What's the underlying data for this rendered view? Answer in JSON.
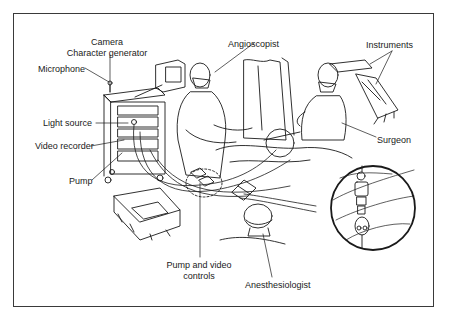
{
  "figure": {
    "type": "line-art illustration",
    "labels": [
      {
        "id": "camera",
        "text": "Camera",
        "x": 107,
        "y": 37,
        "align": "center"
      },
      {
        "id": "character-generator",
        "text": "Character generator",
        "x": 107,
        "y": 48,
        "align": "center"
      },
      {
        "id": "microphone",
        "text": "Microphone",
        "x": 38,
        "y": 64,
        "align": "left"
      },
      {
        "id": "angioscopist",
        "text": "Angioscopist",
        "x": 228,
        "y": 39,
        "align": "left"
      },
      {
        "id": "instruments",
        "text": "Instruments",
        "x": 366,
        "y": 40,
        "align": "left"
      },
      {
        "id": "light-source",
        "text": "Light source",
        "x": 43,
        "y": 118,
        "align": "left"
      },
      {
        "id": "video-recorder",
        "text": "Video recorder",
        "x": 35,
        "y": 141,
        "align": "left"
      },
      {
        "id": "surgeon",
        "text": "Surgeon",
        "x": 377,
        "y": 135,
        "align": "left"
      },
      {
        "id": "pump",
        "text": "Pump",
        "x": 69,
        "y": 176,
        "align": "left"
      },
      {
        "id": "pump-and-video-controls-1",
        "text": "Pump and video",
        "x": 199,
        "y": 260,
        "align": "center"
      },
      {
        "id": "pump-and-video-controls-2",
        "text": "controls",
        "x": 199,
        "y": 271,
        "align": "center"
      },
      {
        "id": "anesthesiologist",
        "text": "Anesthesiologist",
        "x": 245,
        "y": 280,
        "align": "left"
      }
    ]
  },
  "colors": {
    "ink": "#1a1a1a",
    "frame": "#3a3a3a",
    "background": "#ffffff"
  }
}
